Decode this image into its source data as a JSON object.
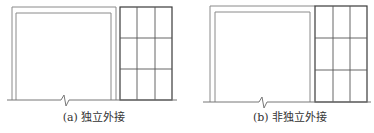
{
  "figure": {
    "panels": [
      {
        "id": "a",
        "caption": "(a) 独立外接",
        "caption_x": 94,
        "caption_y": 112,
        "description": "Independent external attachment: double-line frame separated from a 3x3 grid structure"
      },
      {
        "id": "b",
        "caption": "(b) 非独立外接",
        "caption_x": 290,
        "caption_y": 112,
        "description": "Non-independent external attachment: double-line frame sharing edge with a 3x3 grid structure"
      }
    ],
    "colors": {
      "frame_line": "#8a8a8a",
      "grid_line": "#555555",
      "grid_outline": "#3a3a3a",
      "ground_line": "#777777",
      "caption_text": "#333333",
      "background": "#ffffff"
    }
  }
}
